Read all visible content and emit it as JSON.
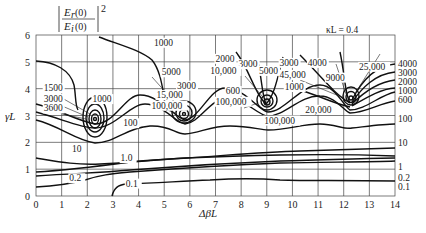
{
  "chart_data": {
    "type": "contour",
    "annotation": "κL = 0.4",
    "xlabel": "ΔβL",
    "ylabel": "γL",
    "xlim": [
      0,
      14
    ],
    "ylim": [
      0,
      6
    ],
    "xticks": [
      "0",
      "1",
      "2",
      "3",
      "4",
      "5",
      "6",
      "7",
      "8",
      "9",
      "10",
      "11",
      "12",
      "13",
      "14"
    ],
    "yticks": [
      "0",
      "1",
      "2",
      "3",
      "4",
      "5",
      "6"
    ],
    "grid": true,
    "peaks": [
      {
        "x": 2.3,
        "y": 2.9
      },
      {
        "x": 5.8,
        "y": 3.15
      },
      {
        "x": 9.0,
        "y": 3.45
      },
      {
        "x": 12.2,
        "y": 3.55
      }
    ],
    "contour_levels_right_edge": [
      "4000",
      "3000",
      "2000",
      "1000",
      "600",
      "100",
      "10",
      "1",
      "0.2",
      "0.1"
    ],
    "contour_labels": [
      {
        "text": "1000",
        "x": 4.6,
        "y": 5.6
      },
      {
        "text": "1500",
        "x": 0.3,
        "y": 3.9
      },
      {
        "text": "3000",
        "x": 0.3,
        "y": 3.5
      },
      {
        "text": "3600",
        "x": 0.3,
        "y": 3.15
      },
      {
        "text": "1000",
        "x": 2.2,
        "y": 3.5
      },
      {
        "text": "5000",
        "x": 4.9,
        "y": 4.5
      },
      {
        "text": "15,000",
        "x": 4.7,
        "y": 3.65
      },
      {
        "text": "100,000",
        "x": 4.5,
        "y": 3.25
      },
      {
        "text": "3000",
        "x": 5.5,
        "y": 4.0
      },
      {
        "text": "2000",
        "x": 7.0,
        "y": 5.0
      },
      {
        "text": "3000",
        "x": 7.9,
        "y": 4.8
      },
      {
        "text": "10,000",
        "x": 6.8,
        "y": 4.55
      },
      {
        "text": "5000",
        "x": 8.7,
        "y": 4.55
      },
      {
        "text": "600",
        "x": 7.4,
        "y": 3.8
      },
      {
        "text": "100,000",
        "x": 7.0,
        "y": 3.4
      },
      {
        "text": "3000",
        "x": 9.5,
        "y": 4.85
      },
      {
        "text": "4000",
        "x": 10.6,
        "y": 4.85
      },
      {
        "text": "45,000",
        "x": 9.5,
        "y": 4.4
      },
      {
        "text": "9000",
        "x": 11.3,
        "y": 4.3
      },
      {
        "text": "25,000",
        "x": 12.6,
        "y": 4.7
      },
      {
        "text": "1000",
        "x": 9.7,
        "y": 3.95
      },
      {
        "text": "20,000",
        "x": 10.5,
        "y": 3.1
      },
      {
        "text": "100,000",
        "x": 8.9,
        "y": 2.7
      },
      {
        "text": "100",
        "x": 3.4,
        "y": 2.6
      },
      {
        "text": "10",
        "x": 1.4,
        "y": 1.65
      },
      {
        "text": "1.0",
        "x": 3.3,
        "y": 1.3
      },
      {
        "text": "0.2",
        "x": 1.3,
        "y": 0.55
      },
      {
        "text": "0.1",
        "x": 3.5,
        "y": 0.35
      }
    ]
  },
  "labels": {
    "formula_num": "E",
    "formula_num_sub": "r",
    "formula_den": "E",
    "formula_den_sub": "i",
    "formula_arg": "(0)",
    "formula_exp": "2",
    "kappa": "κL = 0.4",
    "xlabel": "ΔβL",
    "ylabel": "γL"
  }
}
